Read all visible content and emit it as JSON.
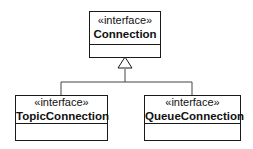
{
  "diagram": {
    "type": "uml-class-diagram",
    "classes": [
      {
        "id": "connection",
        "stereotype": "«interface»",
        "name": "Connection"
      },
      {
        "id": "topic",
        "stereotype": "«interface»",
        "name": "TopicConnection"
      },
      {
        "id": "queue",
        "stereotype": "«interface»",
        "name": "QueueConnection"
      }
    ],
    "relations": [
      {
        "type": "generalization",
        "from": "TopicConnection",
        "to": "Connection"
      },
      {
        "type": "generalization",
        "from": "QueueConnection",
        "to": "Connection"
      }
    ]
  }
}
